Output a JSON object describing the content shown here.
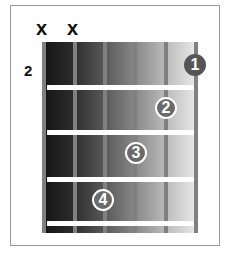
{
  "diagram": {
    "type": "guitar-chord-diagram",
    "start_fret": "2",
    "muted_strings": [
      "x",
      "x"
    ],
    "strings": 6,
    "fingers": [
      {
        "label": "1",
        "string": 6,
        "fret": 1
      },
      {
        "label": "2",
        "string": 5,
        "fret": 2
      },
      {
        "label": "3",
        "string": 4,
        "fret": 3
      },
      {
        "label": "4",
        "string": 3,
        "fret": 4
      }
    ]
  }
}
